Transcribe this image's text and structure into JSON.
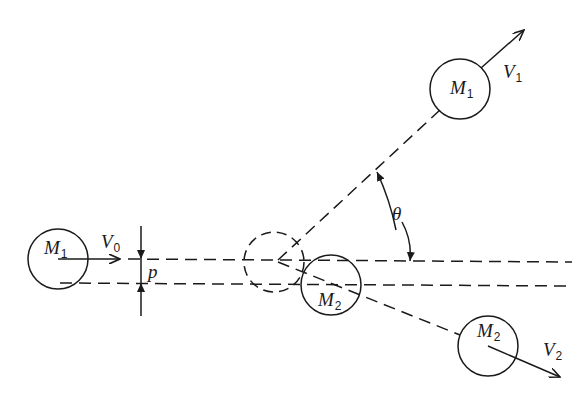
{
  "diagram": {
    "stroke_color": "#1a1a1a",
    "background": "#ffffff"
  },
  "labels": {
    "m1_initial": {
      "main": "M",
      "sub": "1"
    },
    "v0": {
      "main": "V",
      "sub": "0"
    },
    "impact_parameter": {
      "main": "p"
    },
    "m2_at_collision": {
      "main": "M",
      "sub": "2"
    },
    "m1_final": {
      "main": "M",
      "sub": "1"
    },
    "v1": {
      "main": "V",
      "sub": "1"
    },
    "theta": {
      "main": "θ"
    },
    "m2_final": {
      "main": "M",
      "sub": "2"
    },
    "v2": {
      "main": "V",
      "sub": "2"
    }
  },
  "bodies": [
    {
      "name": "M1 initial",
      "cx": 50,
      "cy": 259,
      "r": 30,
      "style": "solid"
    },
    {
      "name": "M1 at collision (ghost)",
      "cx": 274,
      "cy": 262,
      "r": 30,
      "style": "dashed"
    },
    {
      "name": "M2 at collision",
      "cx": 331,
      "cy": 284,
      "r": 30,
      "style": "solid"
    },
    {
      "name": "M1 final",
      "cx": 460,
      "cy": 89,
      "r": 30,
      "style": "solid"
    },
    {
      "name": "M2 final",
      "cx": 488,
      "cy": 346,
      "r": 30,
      "style": "solid"
    }
  ]
}
